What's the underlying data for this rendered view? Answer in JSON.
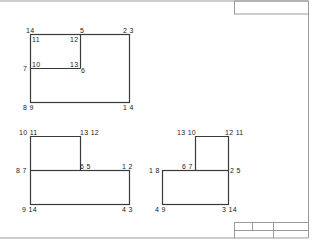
{
  "sheet": {
    "border_color": "#9a9a9a",
    "line_color": "#3a3a3a",
    "title_block": {
      "cells": [
        "",
        "",
        "",
        "",
        ""
      ]
    },
    "header_box": {
      "text": ""
    }
  },
  "figures": [
    {
      "id": "top-left",
      "labels": [
        {
          "text": "14",
          "x": 26,
          "y": 27
        },
        {
          "text": "11",
          "x": 32,
          "y": 36
        },
        {
          "text": "5",
          "x": 80,
          "y": 27
        },
        {
          "text": "12",
          "x": 70,
          "y": 36
        },
        {
          "text": "2 3",
          "x": 123,
          "y": 27
        },
        {
          "text": "7",
          "x": 23,
          "y": 65
        },
        {
          "text": "10",
          "x": 32,
          "y": 61
        },
        {
          "text": "13",
          "x": 70,
          "y": 61
        },
        {
          "text": "6",
          "x": 81,
          "y": 67
        },
        {
          "text": "8 9",
          "x": 23,
          "y": 104
        },
        {
          "text": "1 4",
          "x": 123,
          "y": 104
        }
      ]
    },
    {
      "id": "bottom-left",
      "labels": [
        {
          "text": "10 11",
          "x": 19,
          "y": 129
        },
        {
          "text": "13 12",
          "x": 80,
          "y": 129
        },
        {
          "text": "8 7",
          "x": 16,
          "y": 167
        },
        {
          "text": "6 5",
          "x": 80,
          "y": 163
        },
        {
          "text": "1 2",
          "x": 122,
          "y": 163
        },
        {
          "text": "9 14",
          "x": 22,
          "y": 206
        },
        {
          "text": "4 3",
          "x": 122,
          "y": 206
        }
      ]
    },
    {
      "id": "bottom-right",
      "labels": [
        {
          "text": "13 10",
          "x": 177,
          "y": 129
        },
        {
          "text": "12 11",
          "x": 225,
          "y": 129
        },
        {
          "text": "1 8",
          "x": 149,
          "y": 167
        },
        {
          "text": "6 7",
          "x": 182,
          "y": 163
        },
        {
          "text": "2 5",
          "x": 230,
          "y": 167
        },
        {
          "text": "4 9",
          "x": 155,
          "y": 206
        },
        {
          "text": "3 14",
          "x": 222,
          "y": 206
        }
      ]
    }
  ]
}
